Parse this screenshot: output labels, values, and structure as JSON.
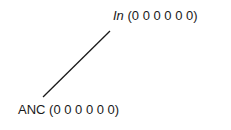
{
  "diagram": {
    "nodes": [
      {
        "id": "in",
        "label_main": "In",
        "label_features": "(0 0 0 0 0 0)",
        "italic_main": true
      },
      {
        "id": "anc",
        "label_main": "ANC",
        "label_features": "(0 0 0 0 0 0)",
        "italic_main": false
      }
    ],
    "edges": [
      {
        "from": "in",
        "to": "anc"
      }
    ],
    "colors": {
      "line": "#1a1a1a",
      "text": "#1a1a1a",
      "background": "#ffffff"
    }
  }
}
